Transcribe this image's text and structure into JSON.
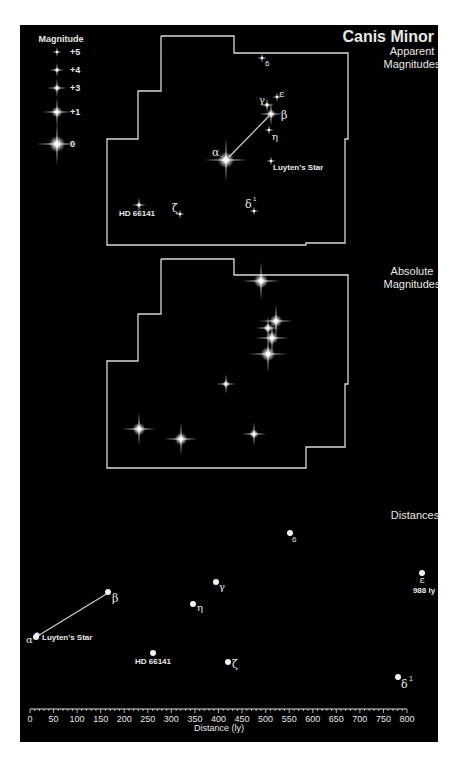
{
  "title": "Canis Minor",
  "sections": {
    "apparent": "Apparent\nMagnitudes",
    "apparent_l1": "Apparent",
    "apparent_l2": "Magnitudes",
    "absolute_l1": "Absolute",
    "absolute_l2": "Magnitudes",
    "distances": "Distances"
  },
  "legend": {
    "title": "Magnitude",
    "items": [
      {
        "label": "+5",
        "size": 2
      },
      {
        "label": "+4",
        "size": 3
      },
      {
        "label": "+3",
        "size": 4
      },
      {
        "label": "+1",
        "size": 6
      },
      {
        "label": "0",
        "size": 9
      }
    ]
  },
  "stars_apparent": [
    {
      "name": "α",
      "x": 226,
      "y": 160,
      "size": 9
    },
    {
      "name": "β",
      "x": 271,
      "y": 114,
      "size": 5
    },
    {
      "name": "γ",
      "x": 267,
      "y": 105,
      "size": 3
    },
    {
      "name": "ε",
      "x": 277,
      "y": 97,
      "size": 2
    },
    {
      "name": "η",
      "x": 269,
      "y": 130,
      "size": 2
    },
    {
      "name": "6",
      "x": 262,
      "y": 58,
      "size": 2
    },
    {
      "name": "Luyten's Star",
      "x": 271,
      "y": 161,
      "size": 2
    },
    {
      "name": "HD 66141",
      "x": 139,
      "y": 205,
      "size": 3
    },
    {
      "name": "ζ",
      "x": 180,
      "y": 214,
      "size": 2
    },
    {
      "name": "δ¹",
      "x": 254,
      "y": 211,
      "size": 2
    }
  ],
  "stars_absolute": [
    {
      "x": 261,
      "y": 281,
      "size": 8
    },
    {
      "x": 276,
      "y": 321,
      "size": 7
    },
    {
      "x": 268,
      "y": 328,
      "size": 5
    },
    {
      "x": 272,
      "y": 338,
      "size": 7
    },
    {
      "x": 268,
      "y": 354,
      "size": 8
    },
    {
      "x": 226,
      "y": 384,
      "size": 4
    },
    {
      "x": 139,
      "y": 429,
      "size": 7
    },
    {
      "x": 181,
      "y": 439,
      "size": 7
    },
    {
      "x": 254,
      "y": 434,
      "size": 5
    }
  ],
  "chart_data": {
    "type": "scatter",
    "title": "Distances",
    "xlabel": "Distance (ly)",
    "xlim": [
      0,
      800
    ],
    "ticks": [
      0,
      50,
      100,
      150,
      200,
      250,
      300,
      350,
      400,
      450,
      500,
      550,
      600,
      650,
      700,
      750,
      800
    ],
    "points": [
      {
        "name": "α",
        "distance": 11
      },
      {
        "name": "Luyten's Star",
        "distance": 12
      },
      {
        "name": "β",
        "distance": 162
      },
      {
        "name": "η",
        "distance": 345
      },
      {
        "name": "γ",
        "distance": 392
      },
      {
        "name": "6",
        "distance": 555
      },
      {
        "name": "HD 66141",
        "distance": 262
      },
      {
        "name": "ζ",
        "distance": 420
      },
      {
        "name": "δ¹",
        "distance": 780
      },
      {
        "name": "ε",
        "distance": 988,
        "note": "988 ly"
      }
    ]
  },
  "axis": {
    "label": "Distance (ly)",
    "tick_labels": [
      "0",
      "50",
      "100",
      "150",
      "200",
      "250",
      "300",
      "350",
      "400",
      "450",
      "500",
      "550",
      "600",
      "650",
      "700",
      "750",
      "800"
    ]
  },
  "labels": {
    "alpha": "α",
    "beta": "β",
    "gamma": "γ",
    "epsilon": "ε",
    "eta": "η",
    "six": "6",
    "luyten": "Luyten's Star",
    "hd": "HD 66141",
    "zeta": "ζ",
    "delta": "δ",
    "delta_sup": "1",
    "eps_dist": "988 ly"
  }
}
